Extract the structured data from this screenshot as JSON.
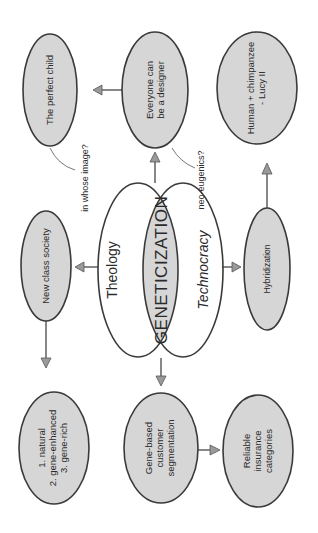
{
  "diagram": {
    "orientation": "rotated-90-ccw",
    "colors": {
      "node_fill": "#d6d6d6",
      "stroke": "#3a3a3a",
      "arrow_fill": "#9a9a9a",
      "background": "#ffffff"
    },
    "center": {
      "label": "GENETICIZATION",
      "ring_left": "Theology",
      "ring_right": "Technocracy"
    },
    "nodes": {
      "perfect_child": {
        "lines": [
          "The perfect child"
        ]
      },
      "designer": {
        "lines": [
          "Everyone can",
          "be a designer"
        ]
      },
      "human_chimp": {
        "lines": [
          "Human + chimpanzee",
          "- Lucy II"
        ]
      },
      "new_class": {
        "lines": [
          "New class society"
        ]
      },
      "hybridization": {
        "lines": [
          "Hybridization"
        ]
      },
      "classes": {
        "lines": [
          "1. natural",
          "2. gene-enhanced",
          "3. gene-rich"
        ]
      },
      "segmentation": {
        "lines": [
          "Gene-based",
          "customer",
          "segmentation"
        ]
      },
      "insurance": {
        "lines": [
          "Reliable",
          "insurance",
          "categories"
        ]
      }
    },
    "annotations": {
      "whose_image": "in whose image?",
      "neo_eugenics": "neo-eugenics?"
    }
  }
}
